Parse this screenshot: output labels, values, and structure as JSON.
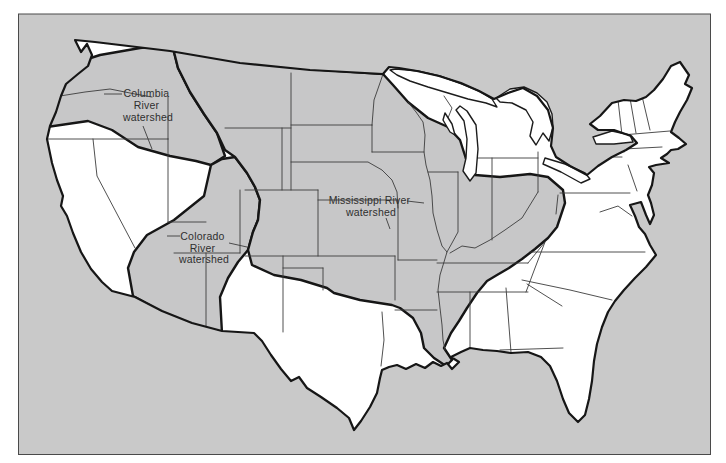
{
  "map": {
    "background_color": "#c9c9c9",
    "watershed_fill_color": "#c7c7c8",
    "land_color": "#ffffff",
    "outline_color": "#161616",
    "state_line_color": "#3c3c3c",
    "frame_border_color": "#4a4a4a",
    "watersheds": [
      "Columbia River watershed",
      "Colorado River watershed",
      "Mississippi River watershed"
    ],
    "labels": {
      "columbia": {
        "lines": [
          "Columbia",
          "River",
          "watershed"
        ]
      },
      "colorado": {
        "lines": [
          "Colorado",
          "River",
          "watershed"
        ]
      },
      "mississippi": {
        "lines": [
          "Mississippi River",
          "watershed"
        ]
      }
    }
  }
}
